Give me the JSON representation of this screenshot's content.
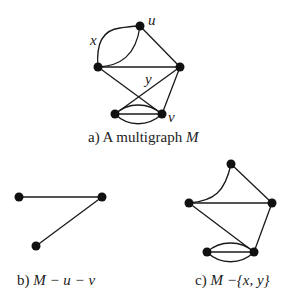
{
  "figure": {
    "panels": [
      {
        "id": "a",
        "caption_prefix": "a) A multigraph ",
        "caption_var": "M",
        "vertex_labels": {
          "u": "u",
          "v": "v"
        },
        "edge_labels": {
          "x": "x",
          "y": "y"
        }
      },
      {
        "id": "b",
        "caption_prefix": "b) ",
        "caption_var": "M",
        "caption_rest": " − u − v"
      },
      {
        "id": "c",
        "caption_prefix": "c) ",
        "caption_var": "M",
        "caption_rest": " −{x, y}"
      }
    ]
  }
}
